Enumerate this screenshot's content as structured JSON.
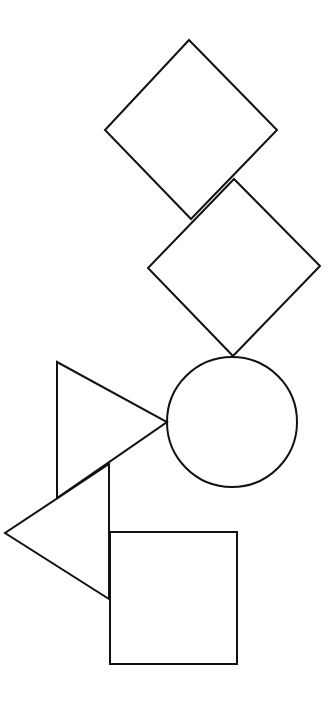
{
  "canvas": {
    "width": 334,
    "height": 701,
    "background": "#ffffff",
    "stroke": "#111111",
    "stroke_width": 2
  },
  "shapes": [
    {
      "id": "diamond-top",
      "type": "diamond",
      "points": "189,40 277,130 191,219 105,130"
    },
    {
      "id": "diamond-middle",
      "type": "diamond",
      "points": "234,179 320,266 233,356 148,268"
    },
    {
      "id": "circle",
      "type": "circle",
      "cx": 232,
      "cy": 422,
      "r": 65
    },
    {
      "id": "triangle-right-pointing",
      "type": "triangle",
      "points": "57,362 167,422 57,498"
    },
    {
      "id": "triangle-left-pointing",
      "type": "triangle",
      "points": "109,464 109,599 5,533"
    },
    {
      "id": "square",
      "type": "square",
      "x": 110,
      "y": 532,
      "width": 127,
      "height": 132
    }
  ]
}
